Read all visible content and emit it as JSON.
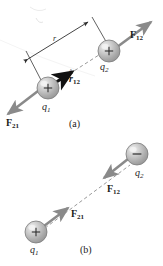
{
  "figure": {
    "background_color": "#ffffff",
    "sphere_fill": "#b9b9b9",
    "sphere_highlight": "#eeeeee",
    "sphere_edge": "#7a7a7a",
    "arrow_color": "#8a8a8a",
    "vector_color": "#111111",
    "dashed_color": "#9a9a9a",
    "leader_color": "#3a3a3a",
    "text_color": "#1c1c1c"
  },
  "panel_a": {
    "caption": "(a)",
    "charge1": {
      "label_q": "q",
      "label_sub": "1",
      "sign": "+"
    },
    "charge2": {
      "label_q": "q",
      "label_sub": "2",
      "sign": "+"
    },
    "force_on_2": {
      "label_f": "F",
      "label_sub": "12"
    },
    "force_on_1": {
      "label_f": "F",
      "label_sub": "21"
    },
    "unit_vector": {
      "label_r": "r",
      "label_hat": "^",
      "label_sub": "12"
    },
    "distance": {
      "label": "r"
    }
  },
  "panel_b": {
    "caption": "(b)",
    "charge1": {
      "label_q": "q",
      "label_sub": "1",
      "sign": "+"
    },
    "charge2": {
      "label_q": "q",
      "label_sub": "2",
      "sign": "−"
    },
    "force_on_2": {
      "label_f": "F",
      "label_sub": "12"
    },
    "force_on_1": {
      "label_f": "F",
      "label_sub": "21"
    }
  }
}
